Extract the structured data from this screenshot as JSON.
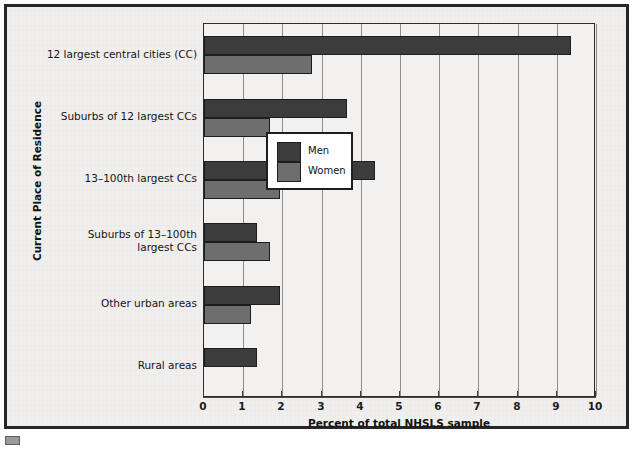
{
  "chart_data": {
    "type": "bar",
    "orientation": "horizontal",
    "title": "",
    "xlabel": "Percent of total NHSLS sample",
    "ylabel": "Current Place of Residence",
    "xlim": [
      0,
      10
    ],
    "xticks": [
      "0",
      "1",
      "2",
      "3",
      "4",
      "5",
      "6",
      "7",
      "8",
      "9",
      "10"
    ],
    "grid": "vertical",
    "legend_position": "center-right",
    "categories": [
      "12 largest central cities (CC)",
      "Suburbs of 12 largest CCs",
      "13–100th largest CCs",
      "Suburbs of 13–100th largest CCs",
      "Other urban areas",
      "Rural areas"
    ],
    "series": [
      {
        "name": "Men",
        "color": "#3c3c3c",
        "values": [
          9.35,
          3.65,
          4.35,
          1.35,
          1.95,
          1.35
        ]
      },
      {
        "name": "Women",
        "color": "#6e6e6e",
        "values": [
          2.75,
          1.68,
          1.95,
          1.68,
          1.2,
          0.0
        ]
      }
    ]
  },
  "legend": {
    "items": [
      {
        "label": "Men",
        "color": "#3c3c3c"
      },
      {
        "label": "Women",
        "color": "#6e6e6e"
      }
    ]
  },
  "axes": {
    "x_title": "Percent of total NHSLS sample",
    "y_title": "Current Place of Residence"
  },
  "colors": {
    "men": "#3c3c3c",
    "women": "#6e6e6e",
    "frame": "#262626",
    "plot_background": "#f2f1ef",
    "page_background": "#f0efed",
    "gridline": "#8d8d8d"
  }
}
